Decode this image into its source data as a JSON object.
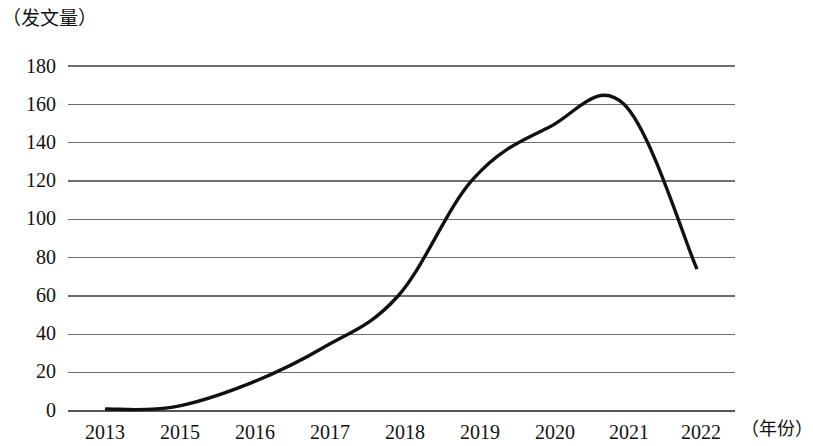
{
  "chart_data": {
    "type": "line",
    "title": "",
    "subtitle": "",
    "xlabel": "（年份）",
    "ylabel": "（发文量）",
    "x": [
      2013,
      2015,
      2016,
      2017,
      2018,
      2019,
      2020,
      2021,
      2022
    ],
    "categories": [
      "2013",
      "2015",
      "2016",
      "2017",
      "2018",
      "2019",
      "2020",
      "2021",
      "2022"
    ],
    "values": [
      1,
      2,
      14,
      33,
      60,
      121,
      148,
      160,
      74
    ],
    "series": [
      {
        "name": "发文量",
        "values": [
          1,
          2,
          14,
          33,
          60,
          121,
          148,
          160,
          74
        ]
      }
    ],
    "ylim": [
      0,
      180
    ],
    "ytick_labels": [
      "180",
      "160",
      "140",
      "120",
      "100",
      "80",
      "60",
      "40",
      "20",
      "0"
    ],
    "ytick_values": [
      180,
      160,
      140,
      120,
      100,
      80,
      60,
      40,
      20,
      0
    ],
    "xtick_labels": [
      "2013",
      "2015",
      "2016",
      "2017",
      "2018",
      "2019",
      "2020",
      "2021",
      "2022"
    ],
    "grid": true,
    "grid_axis": "y",
    "legend": false,
    "legend_position": "none",
    "line_color": "#111111",
    "grid_color": "#6e6e6e",
    "background_color": "#ffffff",
    "markers": false,
    "annotations": []
  },
  "axis_titles": {
    "y": "（发文量）",
    "x": "（年份）"
  },
  "y_ticks": [
    {
      "label": "180"
    },
    {
      "label": "160"
    },
    {
      "label": "140"
    },
    {
      "label": "120"
    },
    {
      "label": "100"
    },
    {
      "label": "80"
    },
    {
      "label": "60"
    },
    {
      "label": "40"
    },
    {
      "label": "20"
    },
    {
      "label": "0"
    }
  ],
  "x_ticks": [
    {
      "label": "2013"
    },
    {
      "label": "2015"
    },
    {
      "label": "2016"
    },
    {
      "label": "2017"
    },
    {
      "label": "2018"
    },
    {
      "label": "2019"
    },
    {
      "label": "2020"
    },
    {
      "label": "2021"
    },
    {
      "label": "2022"
    }
  ]
}
